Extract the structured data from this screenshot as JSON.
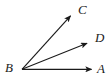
{
  "figure": {
    "kind": "geometry-diagram",
    "background_color": "#ffffff",
    "stroke_color": "#1a1a1a",
    "label_color": "#1a1a1a",
    "width": 109,
    "height": 83,
    "vertex": {
      "name": "B",
      "x": 22,
      "y": 69
    },
    "labels": {
      "a": "A",
      "b": "B",
      "c": "C",
      "d": "D"
    },
    "rays": [
      {
        "name": "ray-BA",
        "from": "B",
        "to": "A",
        "x1": 22,
        "y1": 69,
        "x2": 93,
        "y2": 69,
        "arrowhead": true,
        "angle_degrees": 0
      },
      {
        "name": "ray-BD",
        "from": "B",
        "to": "D",
        "x1": 22,
        "y1": 69,
        "x2": 89,
        "y2": 42,
        "arrowhead": true,
        "angle_degrees": 22
      },
      {
        "name": "ray-BC",
        "from": "B",
        "to": "C",
        "x1": 22,
        "y1": 69,
        "x2": 72,
        "y2": 14,
        "arrowhead": true,
        "angle_degrees": 48
      }
    ]
  }
}
